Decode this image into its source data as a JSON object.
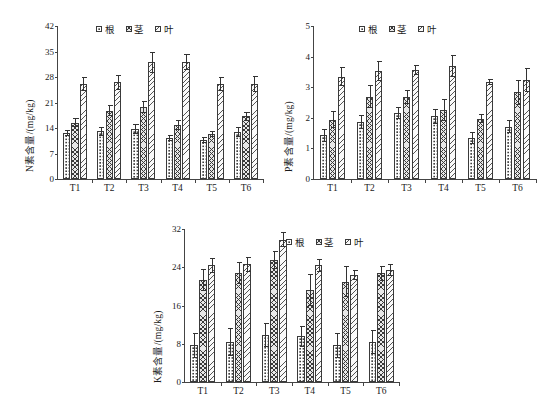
{
  "figure": {
    "background": "#ffffff",
    "axis_color": "#3a3a3a",
    "panel_count": 3
  },
  "legend": {
    "items": [
      {
        "label": "根",
        "pattern": "dots",
        "swatch_name": "legend-swatch-root"
      },
      {
        "label": "茎",
        "pattern": "cross",
        "swatch_name": "legend-swatch-stem"
      },
      {
        "label": "叶",
        "pattern": "diag",
        "swatch_name": "legend-swatch-leaf"
      }
    ]
  },
  "chart_data": [
    {
      "id": "nitrogen",
      "type": "bar",
      "title": "",
      "xlabel": "",
      "ylabel": "N素含量/(mg/kg)",
      "categories": [
        "T1",
        "T2",
        "T3",
        "T4",
        "T5",
        "T6"
      ],
      "ylim": [
        0,
        42
      ],
      "yticks": [
        0,
        7,
        14,
        21,
        28,
        35,
        42
      ],
      "grid": false,
      "legend_position": "top-center",
      "series": [
        {
          "name": "根",
          "pattern": "dots",
          "values": [
            12.6,
            13.1,
            13.7,
            11.3,
            10.7,
            12.9
          ],
          "errors": [
            0.9,
            1.2,
            1.3,
            0.9,
            0.8,
            1.3
          ]
        },
        {
          "name": "茎",
          "pattern": "cross",
          "values": [
            15.5,
            18.8,
            19.7,
            14.9,
            12.4,
            17.2
          ],
          "errors": [
            1.3,
            1.4,
            1.6,
            1.4,
            0.8,
            1.2
          ]
        },
        {
          "name": "叶",
          "pattern": "diag",
          "values": [
            26.1,
            26.5,
            32.1,
            32.1,
            26.1,
            26.1
          ],
          "errors": [
            1.9,
            2.1,
            2.9,
            2.2,
            2.0,
            2.1
          ]
        }
      ]
    },
    {
      "id": "phosphorus",
      "type": "bar",
      "title": "",
      "xlabel": "",
      "ylabel": "P素含量/(mg/kg)",
      "categories": [
        "T1",
        "T2",
        "T3",
        "T4",
        "T5",
        "T6"
      ],
      "ylim": [
        0,
        5
      ],
      "yticks": [
        0,
        1,
        2,
        3,
        4,
        5
      ],
      "grid": false,
      "legend_position": "top-center",
      "series": [
        {
          "name": "根",
          "pattern": "dots",
          "values": [
            1.43,
            1.86,
            2.15,
            2.05,
            1.34,
            1.71
          ],
          "errors": [
            0.22,
            0.24,
            0.2,
            0.25,
            0.19,
            0.22
          ]
        },
        {
          "name": "茎",
          "pattern": "cross",
          "values": [
            1.94,
            2.69,
            2.69,
            2.26,
            1.97,
            2.84
          ],
          "errors": [
            0.27,
            0.37,
            0.23,
            0.37,
            0.15,
            0.41
          ]
        },
        {
          "name": "叶",
          "pattern": "diag",
          "values": [
            3.34,
            3.53,
            3.56,
            3.69,
            3.16,
            3.24
          ],
          "errors": [
            0.31,
            0.34,
            0.15,
            0.35,
            0.1,
            0.4
          ]
        }
      ]
    },
    {
      "id": "potassium",
      "type": "bar",
      "title": "",
      "xlabel": "",
      "ylabel": "K素含量/(mg/kg)",
      "categories": [
        "T1",
        "T2",
        "T3",
        "T4",
        "T5",
        "T6"
      ],
      "ylim": [
        0,
        32
      ],
      "yticks": [
        0,
        8,
        16,
        24,
        32
      ],
      "grid": false,
      "legend_position": "top-right",
      "series": [
        {
          "name": "根",
          "pattern": "dots",
          "values": [
            7.7,
            8.3,
            9.8,
            9.6,
            7.7,
            8.3
          ],
          "errors": [
            2.6,
            2.9,
            2.5,
            2.2,
            2.6,
            2.5
          ]
        },
        {
          "name": "茎",
          "pattern": "cross",
          "values": [
            21.3,
            22.8,
            25.5,
            19.3,
            21.0,
            22.7
          ],
          "errors": [
            2.3,
            2.2,
            1.9,
            3.3,
            3.3,
            1.5
          ]
        },
        {
          "name": "叶",
          "pattern": "diag",
          "values": [
            24.4,
            24.6,
            29.8,
            24.4,
            22.4,
            23.4
          ],
          "errors": [
            1.6,
            1.6,
            1.5,
            1.4,
            1.1,
            1.2
          ]
        }
      ]
    }
  ]
}
